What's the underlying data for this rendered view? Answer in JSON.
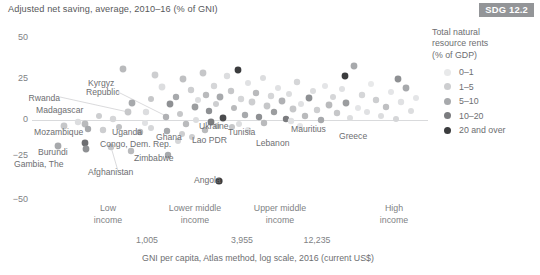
{
  "title": "Adjusted net saving, average, 2010–16 (% of GNI)",
  "badge": {
    "label": "SDG 12.2",
    "color": "#939598"
  },
  "legend": {
    "title_line1": "Total natural",
    "title_line2": "resource rents",
    "title_line3": "(% of GDP)",
    "items": [
      {
        "label": "0–1",
        "color": "#e8e9ea"
      },
      {
        "label": "1–5",
        "color": "#cdced0"
      },
      {
        "label": "5–10",
        "color": "#a7a9ac"
      },
      {
        "label": "10–20",
        "color": "#7b7c7f"
      },
      {
        "label": "20 and over",
        "color": "#3b3c3e"
      }
    ]
  },
  "chart_data": {
    "type": "scatter",
    "title": "Adjusted net saving, average, 2010–16 (% of GNI)",
    "xlabel": "GNI per capita, Atlas method, log scale, 2016 (current US$)",
    "ylabel": "Adjusted net saving, average, 2010–16 (% of GNI)",
    "xscale": "log",
    "ylim": [
      -55,
      55
    ],
    "yticks": [
      50,
      25,
      0,
      -25,
      -50
    ],
    "ytick_labels": [
      "50",
      "25",
      "0",
      "−25",
      "−50"
    ],
    "grid": false,
    "zero_line": true,
    "legend_position": "right",
    "legend_title": "Total natural resource rents (% of GDP)",
    "x_boundaries": [
      {
        "value": 1005,
        "label": "1,005"
      },
      {
        "value": 3955,
        "label": "3,955"
      },
      {
        "value": 12235,
        "label": "12,235"
      }
    ],
    "x_groups": [
      {
        "line1": "Low",
        "line2": "income"
      },
      {
        "line1": "Lower middle",
        "line2": "income"
      },
      {
        "line1": "Upper middle",
        "line2": "income"
      },
      {
        "line1": "High",
        "line2": "income"
      }
    ],
    "series": [
      {
        "name": "0–1",
        "color": "#e8e9ea"
      },
      {
        "name": "1–5",
        "color": "#cdced0"
      },
      {
        "name": "5–10",
        "color": "#a7a9ac"
      },
      {
        "name": "10–20",
        "color": "#7b7c7f"
      },
      {
        "name": "20 and over",
        "color": "#3b3c3e"
      }
    ],
    "annotations": [
      {
        "text": "Rwanda",
        "x": 56,
        "y": 100,
        "anchor": "end",
        "leader_to": [
          128,
          112
        ]
      },
      {
        "text": "Madagascar",
        "x": 36,
        "y": 112,
        "anchor": "start",
        "leader_to": null
      },
      {
        "text": "Kyrgyz",
        "x": 88,
        "y": 85,
        "anchor": "start",
        "leader_to": null
      },
      {
        "text": "Republic",
        "x": 86,
        "y": 94,
        "anchor": "start",
        "leader_to": [
          166,
          116
        ]
      },
      {
        "text": "Mozambique",
        "x": 34,
        "y": 134,
        "anchor": "start",
        "leader_to": null
      },
      {
        "text": "Uganda",
        "x": 112,
        "y": 134,
        "anchor": "start",
        "leader_to": null
      },
      {
        "text": "Ghana",
        "x": 156,
        "y": 139,
        "anchor": "start",
        "leader_to": null
      },
      {
        "text": "Ukraine",
        "x": 199,
        "y": 128,
        "anchor": "start",
        "leader_to": null
      },
      {
        "text": "Tunisia",
        "x": 228,
        "y": 134,
        "anchor": "start",
        "leader_to": null
      },
      {
        "text": "Mauritius",
        "x": 291,
        "y": 131,
        "anchor": "start",
        "leader_to": null
      },
      {
        "text": "Greece",
        "x": 339,
        "y": 138,
        "anchor": "start",
        "leader_to": null
      },
      {
        "text": "Lebanon",
        "x": 256,
        "y": 145,
        "anchor": "start",
        "leader_to": null
      },
      {
        "text": "Lao PDR",
        "x": 192,
        "y": 142,
        "anchor": "start",
        "leader_to": null
      },
      {
        "text": "Congo, Dem. Rep.",
        "x": 100,
        "y": 146,
        "anchor": "start",
        "leader_to": null
      },
      {
        "text": "Burundi",
        "x": 38,
        "y": 154,
        "anchor": "start",
        "leader_to": null
      },
      {
        "text": "Gambia, The",
        "x": 14,
        "y": 166,
        "anchor": "start",
        "leader_to": null
      },
      {
        "text": "Zimbabwe",
        "x": 134,
        "y": 160,
        "anchor": "start",
        "leader_to": null
      },
      {
        "text": "Afghanistan",
        "x": 88,
        "y": 174,
        "anchor": "start",
        "leader_to": [
          111,
          147
        ]
      },
      {
        "text": "Angola",
        "x": 194,
        "y": 182,
        "anchor": "start",
        "leader_to": null
      }
    ],
    "points": [
      {
        "px": 123,
        "py": 69,
        "r": 3.4,
        "c": "#b9babc"
      },
      {
        "px": 155,
        "py": 75,
        "r": 3.4,
        "c": "#cdced0"
      },
      {
        "px": 162,
        "py": 87,
        "r": 3.4,
        "c": "#dcdddf"
      },
      {
        "px": 132,
        "py": 103,
        "r": 3.4,
        "c": "#a7a9ac"
      },
      {
        "px": 146,
        "py": 112,
        "r": 3.2,
        "c": "#dcdddf"
      },
      {
        "px": 151,
        "py": 99,
        "r": 3.0,
        "c": "#c6c7c9"
      },
      {
        "px": 166,
        "py": 117,
        "r": 3.2,
        "c": "#b0b1b4"
      },
      {
        "px": 170,
        "py": 104,
        "r": 3.4,
        "c": "#8e9093"
      },
      {
        "px": 176,
        "py": 97,
        "r": 3.2,
        "c": "#a7a9ac"
      },
      {
        "px": 180,
        "py": 114,
        "r": 3.0,
        "c": "#c6c7c9"
      },
      {
        "px": 183,
        "py": 79,
        "r": 3.4,
        "c": "#bfc0c2"
      },
      {
        "px": 191,
        "py": 90,
        "r": 3.2,
        "c": "#cdced0"
      },
      {
        "px": 195,
        "py": 107,
        "r": 3.4,
        "c": "#9b9d9f"
      },
      {
        "px": 198,
        "py": 100,
        "r": 3.0,
        "c": "#dcdddf"
      },
      {
        "px": 203,
        "py": 73,
        "r": 3.4,
        "c": "#c6c7c9"
      },
      {
        "px": 206,
        "py": 95,
        "r": 3.2,
        "c": "#b9babc"
      },
      {
        "px": 209,
        "py": 111,
        "r": 3.2,
        "c": "#8e9093"
      },
      {
        "px": 214,
        "py": 86,
        "r": 3.2,
        "c": "#d5d6d8"
      },
      {
        "px": 216,
        "py": 104,
        "r": 3.0,
        "c": "#cdced0"
      },
      {
        "px": 220,
        "py": 97,
        "r": 3.4,
        "c": "#a7a9ac"
      },
      {
        "px": 223,
        "py": 118,
        "r": 3.4,
        "c": "#4a4b4d"
      },
      {
        "px": 227,
        "py": 76,
        "r": 3.2,
        "c": "#dcdddf"
      },
      {
        "px": 231,
        "py": 91,
        "r": 3.2,
        "c": "#c6c7c9"
      },
      {
        "px": 234,
        "py": 108,
        "r": 3.0,
        "c": "#b9babc"
      },
      {
        "px": 238,
        "py": 70,
        "r": 3.4,
        "c": "#3b3c3e"
      },
      {
        "px": 241,
        "py": 99,
        "r": 3.2,
        "c": "#d5d6d8"
      },
      {
        "px": 245,
        "py": 115,
        "r": 3.2,
        "c": "#a7a9ac"
      },
      {
        "px": 248,
        "py": 83,
        "r": 3.0,
        "c": "#e0e1e3"
      },
      {
        "px": 252,
        "py": 102,
        "r": 3.4,
        "c": "#cdced0"
      },
      {
        "px": 256,
        "py": 93,
        "r": 3.2,
        "c": "#b9babc"
      },
      {
        "px": 259,
        "py": 117,
        "r": 3.2,
        "c": "#8e9093"
      },
      {
        "px": 263,
        "py": 78,
        "r": 3.0,
        "c": "#dcdddf"
      },
      {
        "px": 267,
        "py": 106,
        "r": 3.4,
        "c": "#c6c7c9"
      },
      {
        "px": 271,
        "py": 96,
        "r": 3.2,
        "c": "#d5d6d8"
      },
      {
        "px": 274,
        "py": 112,
        "r": 3.2,
        "c": "#9b9d9f"
      },
      {
        "px": 278,
        "py": 88,
        "r": 3.0,
        "c": "#e0e1e3"
      },
      {
        "px": 282,
        "py": 101,
        "r": 3.4,
        "c": "#b0b1b4"
      },
      {
        "px": 286,
        "py": 119,
        "r": 3.2,
        "c": "#7b7c7f"
      },
      {
        "px": 289,
        "py": 94,
        "r": 3.0,
        "c": "#dcdddf"
      },
      {
        "px": 293,
        "py": 109,
        "r": 3.4,
        "c": "#c6c7c9"
      },
      {
        "px": 297,
        "py": 82,
        "r": 3.2,
        "c": "#d5d6d8"
      },
      {
        "px": 301,
        "py": 104,
        "r": 3.0,
        "c": "#e0e1e3"
      },
      {
        "px": 305,
        "py": 116,
        "r": 3.2,
        "c": "#b9babc"
      },
      {
        "px": 309,
        "py": 98,
        "r": 3.4,
        "c": "#8e9093"
      },
      {
        "px": 313,
        "py": 91,
        "r": 3.0,
        "c": "#dcdddf"
      },
      {
        "px": 317,
        "py": 110,
        "r": 3.2,
        "c": "#cdced0"
      },
      {
        "px": 321,
        "py": 120,
        "r": 3.2,
        "c": "#a7a9ac"
      },
      {
        "px": 325,
        "py": 86,
        "r": 3.0,
        "c": "#e4e5e7"
      },
      {
        "px": 329,
        "py": 105,
        "r": 3.4,
        "c": "#b9babc"
      },
      {
        "px": 333,
        "py": 97,
        "r": 3.0,
        "c": "#d5d6d8"
      },
      {
        "px": 337,
        "py": 113,
        "r": 3.2,
        "c": "#c6c7c9"
      },
      {
        "px": 342,
        "py": 89,
        "r": 3.0,
        "c": "#e0e1e3"
      },
      {
        "px": 346,
        "py": 103,
        "r": 3.4,
        "c": "#9b9d9f"
      },
      {
        "px": 350,
        "py": 118,
        "r": 3.0,
        "c": "#dcdddf"
      },
      {
        "px": 354,
        "py": 66,
        "r": 3.4,
        "c": "#a7a9ac"
      },
      {
        "px": 358,
        "py": 108,
        "r": 3.0,
        "c": "#e4e5e7"
      },
      {
        "px": 362,
        "py": 95,
        "r": 3.2,
        "c": "#d5d6d8"
      },
      {
        "px": 367,
        "py": 112,
        "r": 3.0,
        "c": "#e0e1e3"
      },
      {
        "px": 371,
        "py": 84,
        "r": 3.0,
        "c": "#e8e9ea"
      },
      {
        "px": 376,
        "py": 100,
        "r": 3.2,
        "c": "#cdced0"
      },
      {
        "px": 381,
        "py": 116,
        "r": 3.0,
        "c": "#dcdddf"
      },
      {
        "px": 386,
        "py": 107,
        "r": 3.2,
        "c": "#bfc0c2"
      },
      {
        "px": 391,
        "py": 92,
        "r": 3.0,
        "c": "#e4e5e7"
      },
      {
        "px": 396,
        "py": 119,
        "r": 3.0,
        "c": "#d5d6d8"
      },
      {
        "px": 401,
        "py": 102,
        "r": 3.2,
        "c": "#e0e1e3"
      },
      {
        "px": 406,
        "py": 88,
        "r": 3.4,
        "c": "#a7a9ac"
      },
      {
        "px": 411,
        "py": 111,
        "r": 3.0,
        "c": "#dcdddf"
      },
      {
        "px": 416,
        "py": 98,
        "r": 3.0,
        "c": "#e4e5e7"
      },
      {
        "px": 345,
        "py": 76,
        "r": 3.4,
        "c": "#3b3c3e"
      },
      {
        "px": 398,
        "py": 79,
        "r": 3.4,
        "c": "#8e9093"
      },
      {
        "px": 291,
        "py": 121,
        "r": 3.2,
        "c": "#e0e1e3"
      },
      {
        "px": 217,
        "py": 126,
        "r": 3.0,
        "c": "#c6c7c9"
      },
      {
        "px": 211,
        "py": 122,
        "r": 3.4,
        "c": "#7b7c7f"
      },
      {
        "px": 196,
        "py": 120,
        "r": 3.0,
        "c": "#dcdddf"
      },
      {
        "px": 186,
        "py": 124,
        "r": 3.2,
        "c": "#b9babc"
      },
      {
        "px": 128,
        "py": 112,
        "r": 3.4,
        "c": "#c6c7c9"
      },
      {
        "px": 113,
        "py": 119,
        "r": 3.2,
        "c": "#d5d6d8"
      },
      {
        "px": 99,
        "py": 116,
        "r": 3.0,
        "c": "#cdced0"
      },
      {
        "px": 85,
        "py": 124,
        "r": 3.4,
        "c": "#b9babc"
      },
      {
        "px": 78,
        "py": 122,
        "r": 3.2,
        "c": "#dcdddf"
      },
      {
        "px": 64,
        "py": 126,
        "r": 3.4,
        "c": "#c6c7c9"
      },
      {
        "px": 88,
        "py": 129,
        "r": 3.2,
        "c": "#a7a9ac"
      },
      {
        "px": 103,
        "py": 130,
        "r": 3.2,
        "c": "#cdced0"
      },
      {
        "px": 119,
        "py": 127,
        "r": 3.0,
        "c": "#bfc0c2"
      },
      {
        "px": 140,
        "py": 132,
        "r": 3.2,
        "c": "#b9babc"
      },
      {
        "px": 151,
        "py": 128,
        "r": 3.0,
        "c": "#d5d6d8"
      },
      {
        "px": 167,
        "py": 131,
        "r": 3.2,
        "c": "#a7a9ac"
      },
      {
        "px": 182,
        "py": 134,
        "r": 3.0,
        "c": "#cdced0"
      },
      {
        "px": 205,
        "py": 130,
        "r": 3.2,
        "c": "#b9babc"
      },
      {
        "px": 232,
        "py": 127,
        "r": 3.0,
        "c": "#c6c7c9"
      },
      {
        "px": 58,
        "py": 146,
        "r": 3.4,
        "c": "#a7a9ac"
      },
      {
        "px": 85,
        "py": 143,
        "r": 3.4,
        "c": "#6d6e71"
      },
      {
        "px": 86,
        "py": 149,
        "r": 3.4,
        "c": "#8e9093"
      },
      {
        "px": 111,
        "py": 147,
        "r": 3.2,
        "c": "#c6c7c9"
      },
      {
        "px": 131,
        "py": 151,
        "r": 3.2,
        "c": "#b9babc"
      },
      {
        "px": 168,
        "py": 155,
        "r": 3.2,
        "c": "#a7a9ac"
      },
      {
        "px": 219,
        "py": 181,
        "r": 3.6,
        "c": "#3b3c3e"
      },
      {
        "px": 178,
        "py": 141,
        "r": 3.0,
        "c": "#d5d6d8"
      },
      {
        "px": 192,
        "py": 137,
        "r": 3.0,
        "c": "#cdced0"
      },
      {
        "px": 239,
        "py": 124,
        "r": 3.0,
        "c": "#dcdddf"
      },
      {
        "px": 248,
        "py": 130,
        "r": 3.0,
        "c": "#e0e1e3"
      },
      {
        "px": 300,
        "py": 126,
        "r": 3.0,
        "c": "#e4e5e7"
      },
      {
        "px": 264,
        "py": 123,
        "r": 3.2,
        "c": "#b9babc"
      },
      {
        "px": 145,
        "py": 123,
        "r": 3.0,
        "c": "#e0e1e3"
      }
    ]
  },
  "axis": {
    "y_ticks": [
      {
        "label": "50",
        "top": 32
      },
      {
        "label": "25",
        "top": 73
      },
      {
        "label": "0",
        "top": 114
      },
      {
        "label": "−25",
        "top": 150
      },
      {
        "label": "−50",
        "top": 194
      }
    ],
    "groups": [
      {
        "line1": "Low",
        "line2": "income",
        "left": 108
      },
      {
        "line1": "Lower middle",
        "line2": "income",
        "left": 195
      },
      {
        "line1": "Upper middle",
        "line2": "income",
        "left": 280
      },
      {
        "line1": "High",
        "line2": "income",
        "left": 394
      }
    ],
    "boundaries": [
      {
        "label": "1,005",
        "left": 147
      },
      {
        "label": "3,955",
        "left": 242
      },
      {
        "label": "12,235",
        "left": 317
      }
    ],
    "xtitle": "GNI per capita, Atlas method, log scale, 2016 (current US$)",
    "xtitle_left": 258
  }
}
